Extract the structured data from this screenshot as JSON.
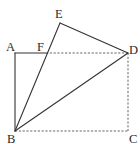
{
  "diagram": {
    "type": "geometry-figure",
    "points": {
      "A": {
        "label": "A",
        "x": 15,
        "y": 53
      },
      "B": {
        "label": "B",
        "x": 15,
        "y": 131
      },
      "C": {
        "label": "C",
        "x": 128,
        "y": 131
      },
      "D": {
        "label": "D",
        "x": 128,
        "y": 53
      },
      "E": {
        "label": "E",
        "x": 60,
        "y": 23
      },
      "F": {
        "label": "F",
        "x": 46,
        "y": 53
      }
    },
    "segments": {
      "solid": [
        [
          "A",
          "B"
        ],
        [
          "A",
          "F"
        ],
        [
          "B",
          "E"
        ],
        [
          "E",
          "D"
        ],
        [
          "B",
          "D"
        ]
      ],
      "dashed": [
        [
          "F",
          "D"
        ],
        [
          "D",
          "C"
        ],
        [
          "B",
          "C"
        ]
      ]
    },
    "colors": {
      "line": "#333333",
      "dashed_line": "#555555",
      "label": "#2a2a2a",
      "background": "#ffffff"
    }
  }
}
